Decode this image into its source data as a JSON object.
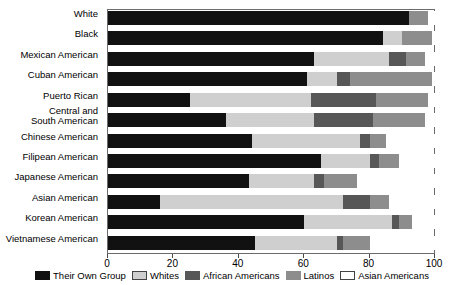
{
  "chart_data": {
    "type": "bar",
    "orientation": "horizontal",
    "stacked": true,
    "title": "",
    "xlabel": "",
    "ylabel": "",
    "xlim": [
      0,
      100
    ],
    "xticks": [
      0,
      20,
      40,
      60,
      80,
      100
    ],
    "xtick_labels": [
      "0",
      "20",
      "40",
      "60",
      "80",
      "100"
    ],
    "grid": false,
    "legend_position": "bottom",
    "categories": [
      "White",
      "Black",
      "Mexican American",
      "Cuban American",
      "Puerto Rican",
      "Central and\nSouth American",
      "Chinese American",
      "Filipean American",
      "Japanese American",
      "Asian American",
      "Korean American",
      "Vietnamese American"
    ],
    "series": [
      {
        "name": "Their Own Group",
        "color": "#111111",
        "values": [
          92,
          84,
          63,
          61,
          25,
          36,
          44,
          65,
          43,
          16,
          60,
          45
        ]
      },
      {
        "name": "Whites",
        "color": "#cfcfcf",
        "values": [
          0,
          6,
          23,
          9,
          37,
          27,
          33,
          15,
          20,
          56,
          27,
          25
        ]
      },
      {
        "name": "African Americans",
        "color": "#575757",
        "values": [
          0,
          0,
          5,
          4,
          20,
          18,
          3,
          3,
          3,
          8,
          2,
          2
        ]
      },
      {
        "name": "Latinos",
        "color": "#8d8d8d",
        "values": [
          6,
          9,
          6,
          25,
          16,
          16,
          5,
          6,
          10,
          6,
          4,
          8
        ]
      },
      {
        "name": "Asian Americans",
        "color": "#ffffff",
        "values": [
          2,
          1,
          3,
          1,
          2,
          3,
          15,
          11,
          24,
          14,
          7,
          20
        ]
      }
    ]
  },
  "legend": {
    "items": [
      {
        "label": "Their Own Group",
        "swatch": "own"
      },
      {
        "label": "Whites",
        "swatch": "whites"
      },
      {
        "label": "African Americans",
        "swatch": "afram"
      },
      {
        "label": "Latinos",
        "swatch": "latin"
      },
      {
        "label": "Asian Americans",
        "swatch": "asian"
      }
    ]
  }
}
